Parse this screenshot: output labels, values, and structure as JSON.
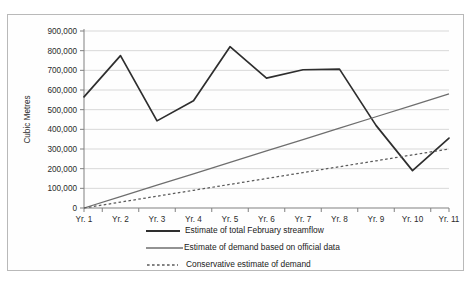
{
  "chart_data": {
    "type": "line",
    "title": "",
    "xlabel": "",
    "ylabel": "Cubic Metres",
    "ylim": [
      0,
      900000
    ],
    "ytick_labels": [
      "900,000",
      "800,000",
      "700,000",
      "600,000",
      "500,000",
      "400,000",
      "300,000",
      "200,000",
      "100,000",
      "0"
    ],
    "ytick_values": [
      900000,
      800000,
      700000,
      600000,
      500000,
      400000,
      300000,
      200000,
      100000,
      0
    ],
    "categories": [
      "Yr. 1",
      "Yr. 2",
      "Yr. 3",
      "Yr. 4",
      "Yr. 5",
      "Yr. 6",
      "Yr. 7",
      "Yr. 8",
      "Yr. 9",
      "Yr. 10",
      "Yr. 11"
    ],
    "grid": true,
    "legend_position": "bottom",
    "series": [
      {
        "name": "Estimate of total February streamflow",
        "style": "solid-thick-dark",
        "color": "#2e2e2e",
        "values": [
          565000,
          775000,
          443000,
          545000,
          820000,
          660000,
          703000,
          706000,
          420000,
          190000,
          355000
        ]
      },
      {
        "name": "Estimate of demand based on official data",
        "style": "solid-thin-gray",
        "color": "#6e6e6e",
        "values": [
          0,
          58000,
          116000,
          174000,
          232000,
          290000,
          348000,
          406000,
          464000,
          522000,
          580000
        ]
      },
      {
        "name": "Conservative estimate of demand",
        "style": "dashed-gray",
        "color": "#5a5a5a",
        "values": [
          0,
          30000,
          60000,
          90000,
          120000,
          150000,
          180000,
          210000,
          240000,
          270000,
          300000
        ]
      }
    ]
  },
  "legend": {
    "items": [
      {
        "label": "Estimate of total February streamflow"
      },
      {
        "label": "Estimate of demand based on official data"
      },
      {
        "label": "Conservative estimate of demand"
      }
    ]
  }
}
